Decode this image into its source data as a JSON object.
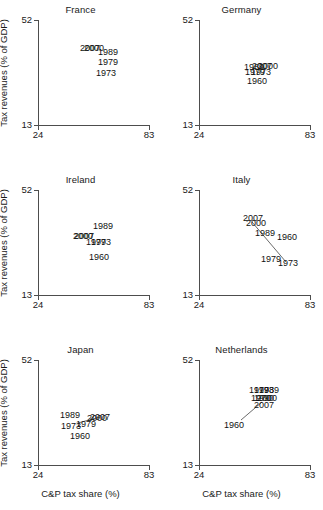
{
  "figure": {
    "xlabel": "C&P tax share (%)",
    "ylabel": "Tax revenues (% of GDP)",
    "xticks": [
      "24",
      "83"
    ],
    "yticks": [
      "13",
      "52"
    ]
  },
  "chart_data": {
    "type": "scatter",
    "title": "",
    "xlabel": "C&P tax share (%)",
    "ylabel": "Tax revenues (% of GDP)",
    "xlim": [
      24,
      83
    ],
    "ylim": [
      13,
      52
    ],
    "xticks": [
      24,
      83
    ],
    "yticks": [
      13,
      52
    ],
    "grid": false,
    "legend": "none",
    "point_labels": "year",
    "panels": [
      {
        "name": "France",
        "points": [
          {
            "label": "2007",
            "x": 63.0,
            "y": 44.0
          },
          {
            "label": "2000",
            "x": 64.5,
            "y": 44.0
          },
          {
            "label": "1989",
            "x": 69.0,
            "y": 43.0
          },
          {
            "label": "1979",
            "x": 68.5,
            "y": 41.0
          },
          {
            "label": "1973",
            "x": 68.0,
            "y": 38.5
          }
        ]
      },
      {
        "name": "Germany",
        "points": [
          {
            "label": "1989",
            "x": 60.0,
            "y": 38.0
          },
          {
            "label": "2007",
            "x": 62.0,
            "y": 38.0
          },
          {
            "label": "2000",
            "x": 63.5,
            "y": 38.0
          },
          {
            "label": "1979",
            "x": 59.5,
            "y": 37.0
          },
          {
            "label": "1973",
            "x": 60.5,
            "y": 37.0
          },
          {
            "label": "1960",
            "x": 60.0,
            "y": 35.0
          }
        ]
      },
      {
        "name": "Ireland",
        "points": [
          {
            "label": "1989",
            "x": 60.0,
            "y": 38.5
          },
          {
            "label": "2007",
            "x": 54.5,
            "y": 36.5
          },
          {
            "label": "2000",
            "x": 54.0,
            "y": 36.5
          },
          {
            "label": "1979",
            "x": 59.0,
            "y": 35.5
          },
          {
            "label": "1973",
            "x": 60.0,
            "y": 35.5
          },
          {
            "label": "1960",
            "x": 59.5,
            "y": 32.0
          }
        ]
      },
      {
        "name": "Italy",
        "points": [
          {
            "label": "2007",
            "x": 57.5,
            "y": 44.0
          },
          {
            "label": "2000",
            "x": 58.5,
            "y": 43.0
          },
          {
            "label": "1989",
            "x": 63.0,
            "y": 40.5
          },
          {
            "label": "1960",
            "x": 71.0,
            "y": 39.5
          },
          {
            "label": "1979",
            "x": 66.5,
            "y": 33.5
          },
          {
            "label": "1973",
            "x": 73.0,
            "y": 32.5
          }
        ]
      },
      {
        "name": "Japan",
        "points": [
          {
            "label": "1989",
            "x": 41.0,
            "y": 36.5
          },
          {
            "label": "2007",
            "x": 53.0,
            "y": 36.0
          },
          {
            "label": "2000",
            "x": 52.0,
            "y": 35.5
          },
          {
            "label": "1979",
            "x": 47.5,
            "y": 34.0
          },
          {
            "label": "1973",
            "x": 41.5,
            "y": 33.0
          },
          {
            "label": "1960",
            "x": 45.0,
            "y": 31.0
          }
        ]
      },
      {
        "name": "Netherlands",
        "points": [
          {
            "label": "1979",
            "x": 62.0,
            "y": 43.5
          },
          {
            "label": "1989",
            "x": 66.0,
            "y": 43.5
          },
          {
            "label": "1973",
            "x": 64.0,
            "y": 43.5
          },
          {
            "label": "1990",
            "x": 66.5,
            "y": 41.5
          },
          {
            "label": "2000",
            "x": 65.0,
            "y": 41.5
          },
          {
            "label": "2007",
            "x": 64.0,
            "y": 40.0
          },
          {
            "label": "1960",
            "x": 55.0,
            "y": 36.5
          }
        ]
      }
    ]
  },
  "panels": [
    {
      "title": "France",
      "show_ylabel": true,
      "show_xlabel": false,
      "labels": [
        {
          "text": "2007",
          "left": 52,
          "top": 28
        },
        {
          "text": "2000",
          "left": 56,
          "top": 28
        },
        {
          "text": "1989",
          "left": 70,
          "top": 32
        },
        {
          "text": "1979",
          "left": 70,
          "top": 42
        },
        {
          "text": "1973",
          "left": 68,
          "top": 53
        }
      ],
      "lines": []
    },
    {
      "title": "Germany",
      "show_ylabel": false,
      "show_xlabel": false,
      "labels": [
        {
          "text": "1989",
          "left": 55,
          "top": 47
        },
        {
          "text": "2007",
          "left": 63,
          "top": 46
        },
        {
          "text": "2000",
          "left": 69,
          "top": 46
        },
        {
          "text": "1979",
          "left": 56,
          "top": 52
        },
        {
          "text": "1973",
          "left": 62,
          "top": 52
        },
        {
          "text": "1960",
          "left": 58,
          "top": 61
        }
      ],
      "lines": []
    },
    {
      "title": "Ireland",
      "show_ylabel": true,
      "show_xlabel": false,
      "labels": [
        {
          "text": "1989",
          "left": 65,
          "top": 36
        },
        {
          "text": "2007",
          "left": 46,
          "top": 46
        },
        {
          "text": "2000",
          "left": 45,
          "top": 46
        },
        {
          "text": "1979",
          "left": 58,
          "top": 52
        },
        {
          "text": "1973",
          "left": 63,
          "top": 52
        },
        {
          "text": "1960",
          "left": 61,
          "top": 67
        }
      ],
      "lines": []
    },
    {
      "title": "Italy",
      "show_ylabel": false,
      "show_xlabel": false,
      "labels": [
        {
          "text": "2007",
          "left": 54,
          "top": 28
        },
        {
          "text": "2000",
          "left": 57,
          "top": 33
        },
        {
          "text": "1989",
          "left": 66,
          "top": 43
        },
        {
          "text": "1960",
          "left": 88,
          "top": 47
        },
        {
          "text": "1979",
          "left": 72,
          "top": 69
        },
        {
          "text": "1973",
          "left": 89,
          "top": 73
        }
      ],
      "lines": [
        {
          "x1": 53,
          "y1": 32,
          "x2": 87,
          "y2": 72
        }
      ]
    },
    {
      "title": "Japan",
      "show_ylabel": true,
      "show_xlabel": true,
      "labels": [
        {
          "text": "1989",
          "left": 32,
          "top": 55
        },
        {
          "text": "2007",
          "left": 62,
          "top": 57
        },
        {
          "text": "2000",
          "left": 59,
          "top": 58
        },
        {
          "text": "1979",
          "left": 48,
          "top": 64
        },
        {
          "text": "1973",
          "left": 33,
          "top": 66
        },
        {
          "text": "1960",
          "left": 42,
          "top": 76
        }
      ],
      "lines": [
        {
          "x1": 40,
          "y1": 63,
          "x2": 62,
          "y2": 57
        }
      ]
    },
    {
      "title": "Netherlands",
      "show_ylabel": false,
      "show_xlabel": true,
      "labels": [
        {
          "text": "1979",
          "left": 60,
          "top": 30
        },
        {
          "text": "1973",
          "left": 65,
          "top": 30
        },
        {
          "text": "1989",
          "left": 70,
          "top": 30
        },
        {
          "text": "1970",
          "left": 62,
          "top": 38
        },
        {
          "text": "2000",
          "left": 68,
          "top": 38
        },
        {
          "text": "1990",
          "left": 65,
          "top": 38
        },
        {
          "text": "2007",
          "left": 65,
          "top": 45
        },
        {
          "text": "1960",
          "left": 35,
          "top": 65
        }
      ],
      "lines": [
        {
          "x1": 42,
          "y1": 60,
          "x2": 63,
          "y2": 42
        }
      ]
    }
  ]
}
